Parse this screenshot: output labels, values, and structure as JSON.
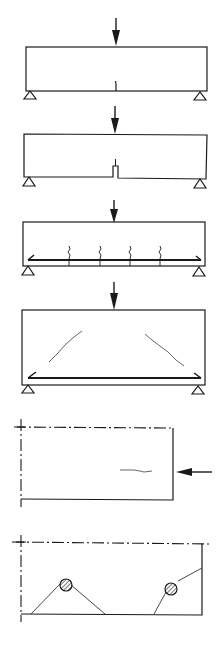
{
  "figure": {
    "ink_color": "#1a1a1a",
    "crack_color": "#555555",
    "background": "#ffffff",
    "panels": [
      {
        "id": "panel-1",
        "label": "Plain beam, single flexural crack at midspan under point load",
        "load": "vertical-point-load",
        "supports": 2
      },
      {
        "id": "panel-2",
        "label": "Notched beam, crack initiating from notch tip",
        "load": "vertical-point-load",
        "supports": 2
      },
      {
        "id": "panel-3",
        "label": "Reinforced beam with multiple flexural cracks",
        "load": "vertical-point-load",
        "supports": 2,
        "cracks": 4
      },
      {
        "id": "panel-4",
        "label": "Reinforced deep beam with diagonal shear cracks",
        "load": "vertical-point-load",
        "supports": 2,
        "cracks": 2
      },
      {
        "id": "panel-5",
        "label": "Half-model with horizontal end load and splitting crack",
        "load": "horizontal-point-load"
      },
      {
        "id": "panel-6",
        "label": "Half-model with two bars and cone pull-out cracks",
        "bars": 2
      }
    ]
  }
}
